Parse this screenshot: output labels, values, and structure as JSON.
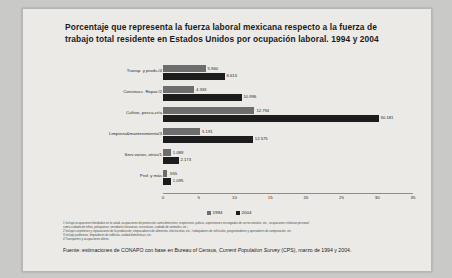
{
  "title": "Porcentaje que representa la fuerza laboral mexicana respecto a la fuerza de trabajo total residente en Estados Unidos por ocupación laboral. 1994 y 2004",
  "legend": {
    "s1": "1994",
    "s2": "2004"
  },
  "notes": [
    "1 Incluye ocupaciones brindadas en la salud, ocupaciones de protección como detectives, inspectores, policía, supervisores encargados de correccionales, etc.; ocupaciones relativas personal",
    "como cuidado de niños, peluqueros, servidores funerarios, recreativos, cuidado de animales, etc.;",
    "2 Incluye carpinteros y reparaciones de la producción, empacadores de alimentos, electricistas, etc.; trabajadores de vehículos, programadores y operadores de computación, etc.",
    "3 Incluye jardineros, limpiadores de edificios, unidad domésticas, etc.",
    "4 Transportes y ocupaciones afines."
  ],
  "source": "Fuente: estimaciones de CONAPO con base en Bureau of Census, Current Population Survey (CPS), marzo de 1994 y 2004.",
  "source_italic": "Current Population Survey",
  "colors": {
    "series_1994": "#6d6d6d",
    "series_2004": "#1c1c1c",
    "page_bg": "#eceae6"
  },
  "chart_data": {
    "type": "bar",
    "orientation": "horizontal",
    "title": "Porcentaje que representa la fuerza laboral mexicana respecto a la fuerza de trabajo total residente en Estados Unidos por ocupación laboral. 1994 y 2004",
    "xlabel": "",
    "ylabel": "",
    "xlim": [
      0,
      35
    ],
    "xticks": [
      0,
      5,
      10,
      15,
      20,
      25,
      30,
      35
    ],
    "grid": false,
    "legend_position": "bottom",
    "categories": [
      "Transp. y prods./4",
      "Construcc. Repar./2",
      "Cultivo, pesca,cría",
      "Limpieza&mantenimiento/3",
      "Serv.varios, otros/1",
      "Prof. y más"
    ],
    "series": [
      {
        "name": "1994",
        "values": [
          5.96,
          4.333,
          12.794,
          5.191,
          1.088,
          0.555
        ],
        "labels": [
          "5.960",
          "4.333",
          "12.794",
          "5.191",
          "1.088",
          ".555"
        ]
      },
      {
        "name": "2004",
        "values": [
          8.615,
          10.996,
          30.181,
          12.575,
          2.173,
          1.095
        ],
        "labels": [
          "8.615",
          "10.996",
          "30.181",
          "12.575",
          "2.173",
          "1.095"
        ]
      }
    ]
  }
}
